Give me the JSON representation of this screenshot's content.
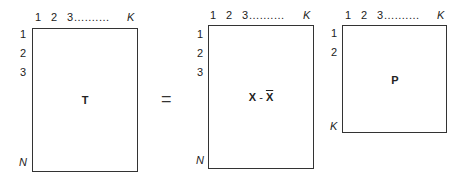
{
  "matrices": [
    {
      "name": "T",
      "label": "T",
      "col_labels": [
        "1",
        "2",
        "3",
        "..........",
        "K"
      ],
      "row_labels": [
        "1",
        "2",
        "3",
        "N"
      ]
    },
    {
      "name": "X-centered",
      "label_left": "X",
      "label_op": " - ",
      "label_right": "X",
      "col_labels": [
        "1",
        "2",
        "3",
        "..........",
        "K"
      ],
      "row_labels": [
        "1",
        "2",
        "3",
        "N"
      ]
    },
    {
      "name": "P",
      "label": "P",
      "col_labels": [
        "1",
        "2",
        "3",
        "..........",
        "K"
      ],
      "row_labels": [
        "1",
        "2",
        "K"
      ]
    }
  ],
  "equals_sign": "="
}
